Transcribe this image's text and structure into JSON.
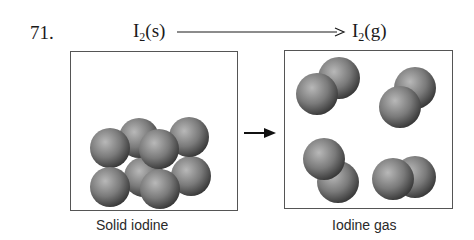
{
  "problem": {
    "number": "71.",
    "reactant": {
      "species": "I",
      "subscript": "2",
      "state": "(s)"
    },
    "product": {
      "species": "I",
      "subscript": "2",
      "state": "(g)"
    },
    "arrow": "reaction-arrow"
  },
  "panels": {
    "left": {
      "caption": "Solid iodine",
      "description": "Close-packed lattice of iodine atoms (solid)"
    },
    "right": {
      "caption": "Iodine gas",
      "description": "Four separated I2 diatomic molecules (gas)"
    }
  },
  "colors": {
    "sphere_light": "#b8b8b8",
    "sphere_mid": "#7a7a7a",
    "sphere_dark": "#3a3a3a",
    "border": "#555555",
    "text": "#1a1a1a"
  }
}
